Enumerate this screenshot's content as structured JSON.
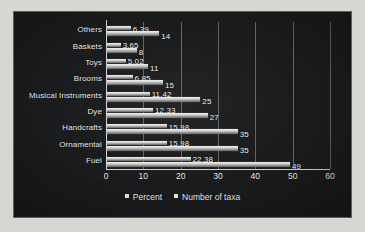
{
  "chart_data": {
    "type": "bar",
    "orientation": "horizontal",
    "title": "",
    "xlabel": "",
    "ylabel": "",
    "xlim": [
      0,
      60
    ],
    "xticks": [
      0,
      10,
      20,
      30,
      40,
      50,
      60
    ],
    "grid": "vertical",
    "legend_position": "bottom",
    "categories": [
      "Others",
      "Baskets",
      "Toys",
      "Brooms",
      "Musical Instruments",
      "Dye",
      "Handcrafts",
      "Ornamental",
      "Fuel"
    ],
    "series": [
      {
        "name": "Percent",
        "values": [
          6.39,
          3.65,
          5.02,
          6.85,
          11.42,
          12.33,
          15.98,
          15.98,
          22.38
        ],
        "labels": [
          "6.39",
          "3.65",
          "5.02",
          "6.85",
          "11.42",
          "12.33",
          "15.98",
          "15.98",
          "22.38"
        ]
      },
      {
        "name": "Number of taxa",
        "values": [
          14,
          8,
          11,
          15,
          25,
          27,
          35,
          35,
          49
        ],
        "labels": [
          "14",
          "8",
          "11",
          "15",
          "25",
          "27",
          "35",
          "35",
          "49"
        ]
      }
    ]
  },
  "legend": {
    "items": [
      {
        "label": "Percent",
        "marker": "square-marker"
      },
      {
        "label": "Number of taxa",
        "marker": "square-marker"
      }
    ]
  },
  "colors": {
    "background": "#17181a",
    "page": "#d8d6d2",
    "bar": "#e3e4e2",
    "axis": "#cfd1d2",
    "gridline": "#6e7073",
    "text": "#ededed"
  }
}
